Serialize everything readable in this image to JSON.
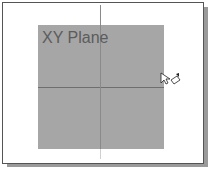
{
  "viewport": {
    "plane_label": "XY Plane",
    "plane_color": "#a6a6a6",
    "axis_color": "#6e6e6e"
  },
  "cursor": {
    "icon": "select-plane-cursor-icon"
  }
}
